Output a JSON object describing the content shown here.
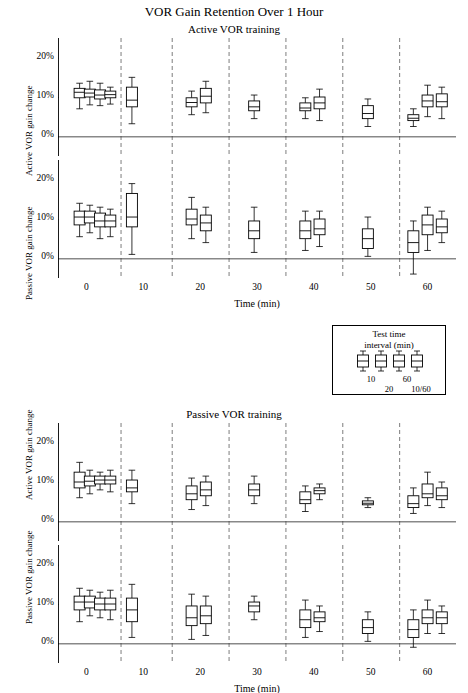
{
  "chart_data": {
    "type": "box",
    "title": "VOR Gain Retention Over 1 Hour",
    "xlabel": "Time (min)",
    "xticks": [
      "0",
      "10",
      "20",
      "30",
      "40",
      "50",
      "60"
    ],
    "yticks": [
      "0%",
      "10%",
      "20%"
    ],
    "ylim": [
      -5,
      25
    ],
    "xlim": [
      -5,
      65
    ],
    "grid": false,
    "panels": [
      {
        "id": "panel-active-vor-training",
        "panel_title": "Active VOR training",
        "subpanels": [
          {
            "id": "subpanel-active-gain-active-training",
            "ylabel": "Active VOR gain change",
            "boxes": [
              {
                "x": -1.2,
                "low": 7.0,
                "q1": 9.8,
                "med": 11.2,
                "q3": 12.2,
                "high": 13.5
              },
              {
                "x": 0.6,
                "low": 8.0,
                "q1": 10.0,
                "med": 11.0,
                "q3": 12.0,
                "high": 14.0
              },
              {
                "x": 2.4,
                "low": 7.8,
                "q1": 9.5,
                "med": 10.5,
                "q3": 11.8,
                "high": 13.5
              },
              {
                "x": 4.2,
                "low": 8.2,
                "q1": 9.8,
                "med": 10.6,
                "q3": 11.5,
                "high": 12.5
              },
              {
                "x": 8.0,
                "low": 3.2,
                "q1": 7.5,
                "med": 9.2,
                "q3": 12.5,
                "high": 15.0
              },
              {
                "x": 18.5,
                "low": 5.5,
                "q1": 7.5,
                "med": 8.6,
                "q3": 9.8,
                "high": 11.5
              },
              {
                "x": 21.0,
                "low": 6.0,
                "q1": 8.5,
                "med": 10.2,
                "q3": 12.2,
                "high": 14.0
              },
              {
                "x": 29.5,
                "low": 4.5,
                "q1": 6.5,
                "med": 7.5,
                "q3": 9.0,
                "high": 10.5
              },
              {
                "x": 38.5,
                "low": 4.5,
                "q1": 6.5,
                "med": 7.2,
                "q3": 8.5,
                "high": 9.8
              },
              {
                "x": 41.0,
                "low": 4.0,
                "q1": 7.0,
                "med": 8.5,
                "q3": 10.0,
                "high": 12.0
              },
              {
                "x": 49.5,
                "low": 2.5,
                "q1": 4.5,
                "med": 5.8,
                "q3": 7.8,
                "high": 9.5
              },
              {
                "x": 57.5,
                "low": 2.5,
                "q1": 4.0,
                "med": 4.6,
                "q3": 5.5,
                "high": 7.0
              },
              {
                "x": 60.0,
                "low": 5.0,
                "q1": 7.5,
                "med": 9.0,
                "q3": 10.5,
                "high": 13.0
              },
              {
                "x": 62.5,
                "low": 4.5,
                "q1": 7.5,
                "med": 8.8,
                "q3": 10.8,
                "high": 12.5
              }
            ]
          },
          {
            "id": "subpanel-passive-gain-active-training",
            "ylabel": "Passive VOR gain change",
            "boxes": [
              {
                "x": -1.2,
                "low": 5.5,
                "q1": 8.5,
                "med": 10.5,
                "q3": 12.0,
                "high": 14.0
              },
              {
                "x": 0.6,
                "low": 6.5,
                "q1": 9.0,
                "med": 10.5,
                "q3": 12.0,
                "high": 13.5
              },
              {
                "x": 2.4,
                "low": 5.0,
                "q1": 8.0,
                "med": 9.5,
                "q3": 11.5,
                "high": 13.0
              },
              {
                "x": 4.2,
                "low": 5.5,
                "q1": 8.0,
                "med": 9.5,
                "q3": 11.0,
                "high": 12.5
              },
              {
                "x": 8.0,
                "low": 1.0,
                "q1": 8.0,
                "med": 10.5,
                "q3": 16.5,
                "high": 19.0
              },
              {
                "x": 18.5,
                "low": 5.0,
                "q1": 8.5,
                "med": 10.0,
                "q3": 12.5,
                "high": 15.5
              },
              {
                "x": 21.0,
                "low": 4.0,
                "q1": 7.0,
                "med": 9.0,
                "q3": 11.0,
                "high": 13.0
              },
              {
                "x": 29.5,
                "low": 1.5,
                "q1": 5.0,
                "med": 7.0,
                "q3": 9.5,
                "high": 13.0
              },
              {
                "x": 38.5,
                "low": 2.0,
                "q1": 5.0,
                "med": 7.0,
                "q3": 9.5,
                "high": 12.0
              },
              {
                "x": 41.0,
                "low": 3.0,
                "q1": 6.0,
                "med": 7.5,
                "q3": 10.0,
                "high": 12.0
              },
              {
                "x": 49.5,
                "low": 0.5,
                "q1": 2.5,
                "med": 5.0,
                "q3": 7.5,
                "high": 10.5
              },
              {
                "x": 57.5,
                "low": -4.0,
                "q1": 1.5,
                "med": 4.0,
                "q3": 7.0,
                "high": 9.5
              },
              {
                "x": 60.0,
                "low": 2.0,
                "q1": 6.0,
                "med": 8.5,
                "q3": 11.0,
                "high": 13.0
              },
              {
                "x": 62.5,
                "low": 4.0,
                "q1": 6.5,
                "med": 8.0,
                "q3": 10.0,
                "high": 12.0
              }
            ]
          }
        ]
      },
      {
        "id": "panel-passive-vor-training",
        "panel_title": "Passive VOR training",
        "subpanels": [
          {
            "id": "subpanel-active-gain-passive-training",
            "ylabel": "Active VOR gain change",
            "boxes": [
              {
                "x": -1.2,
                "low": 6.0,
                "q1": 8.5,
                "med": 10.0,
                "q3": 12.5,
                "high": 15.0
              },
              {
                "x": 0.6,
                "low": 7.0,
                "q1": 9.0,
                "med": 10.2,
                "q3": 11.5,
                "high": 13.0
              },
              {
                "x": 2.4,
                "low": 8.0,
                "q1": 9.5,
                "med": 10.5,
                "q3": 11.5,
                "high": 12.5
              },
              {
                "x": 4.2,
                "low": 7.5,
                "q1": 9.5,
                "med": 10.5,
                "q3": 11.5,
                "high": 13.0
              },
              {
                "x": 8.0,
                "low": 4.5,
                "q1": 7.5,
                "med": 8.5,
                "q3": 10.5,
                "high": 13.0
              },
              {
                "x": 18.5,
                "low": 3.0,
                "q1": 5.5,
                "med": 7.0,
                "q3": 9.0,
                "high": 11.0
              },
              {
                "x": 21.0,
                "low": 4.0,
                "q1": 6.5,
                "med": 8.0,
                "q3": 10.0,
                "high": 11.5
              },
              {
                "x": 29.5,
                "low": 4.5,
                "q1": 6.5,
                "med": 8.0,
                "q3": 9.5,
                "high": 11.5
              },
              {
                "x": 38.5,
                "low": 2.5,
                "q1": 4.5,
                "med": 5.5,
                "q3": 7.5,
                "high": 9.0
              },
              {
                "x": 41.0,
                "low": 5.5,
                "q1": 7.0,
                "med": 7.8,
                "q3": 8.5,
                "high": 9.5
              },
              {
                "x": 49.5,
                "low": 3.5,
                "q1": 4.2,
                "med": 4.6,
                "q3": 5.2,
                "high": 6.0
              },
              {
                "x": 57.5,
                "low": 2.0,
                "q1": 3.5,
                "med": 4.5,
                "q3": 6.5,
                "high": 8.5
              },
              {
                "x": 60.0,
                "low": 4.0,
                "q1": 6.0,
                "med": 7.0,
                "q3": 9.5,
                "high": 12.5
              },
              {
                "x": 62.5,
                "low": 3.5,
                "q1": 5.5,
                "med": 6.5,
                "q3": 8.5,
                "high": 10.0
              }
            ]
          },
          {
            "id": "subpanel-passive-gain-passive-training",
            "ylabel": "Passive VOR gain change",
            "boxes": [
              {
                "x": -1.2,
                "low": 5.5,
                "q1": 8.5,
                "med": 10.5,
                "q3": 12.0,
                "high": 14.0
              },
              {
                "x": 0.6,
                "low": 7.0,
                "q1": 9.0,
                "med": 10.5,
                "q3": 12.0,
                "high": 13.5
              },
              {
                "x": 2.4,
                "low": 6.5,
                "q1": 8.5,
                "med": 10.0,
                "q3": 11.5,
                "high": 13.0
              },
              {
                "x": 4.2,
                "low": 6.0,
                "q1": 8.5,
                "med": 10.0,
                "q3": 11.5,
                "high": 13.5
              },
              {
                "x": 8.0,
                "low": 1.5,
                "q1": 5.5,
                "med": 8.5,
                "q3": 11.5,
                "high": 15.0
              },
              {
                "x": 18.5,
                "low": 1.0,
                "q1": 4.5,
                "med": 6.5,
                "q3": 9.5,
                "high": 12.5
              },
              {
                "x": 21.0,
                "low": 2.0,
                "q1": 5.0,
                "med": 7.0,
                "q3": 9.5,
                "high": 12.0
              },
              {
                "x": 29.5,
                "low": 6.0,
                "q1": 8.0,
                "med": 9.5,
                "q3": 10.5,
                "high": 12.0
              },
              {
                "x": 38.5,
                "low": 1.5,
                "q1": 4.0,
                "med": 6.0,
                "q3": 8.5,
                "high": 11.0
              },
              {
                "x": 41.0,
                "low": 3.0,
                "q1": 5.5,
                "med": 6.5,
                "q3": 8.0,
                "high": 9.5
              },
              {
                "x": 49.5,
                "low": 0.5,
                "q1": 2.5,
                "med": 4.0,
                "q3": 6.0,
                "high": 8.0
              },
              {
                "x": 57.5,
                "low": -1.0,
                "q1": 1.5,
                "med": 3.5,
                "q3": 6.0,
                "high": 8.5
              },
              {
                "x": 60.0,
                "low": 2.5,
                "q1": 5.0,
                "med": 6.5,
                "q3": 8.5,
                "high": 11.0
              },
              {
                "x": 62.5,
                "low": 2.5,
                "q1": 5.0,
                "med": 6.5,
                "q3": 8.0,
                "high": 9.5
              }
            ]
          }
        ]
      }
    ],
    "separator_lines_x": [
      6,
      15,
      25,
      35,
      45,
      55
    ],
    "legend": {
      "title_line1": "Test time",
      "title_line2": "interval (min)",
      "labels": [
        "10",
        "20",
        "60",
        "10/60"
      ]
    }
  }
}
